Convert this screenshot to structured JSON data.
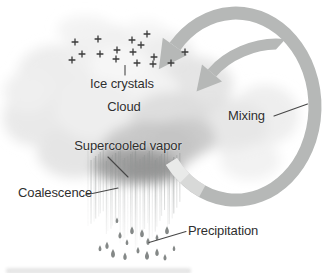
{
  "figure": {
    "background": "#ffffff",
    "labels": {
      "ice_crystals": "Ice crystals",
      "cloud": "Cloud",
      "mixing": "Mixing",
      "supercooled_vapor": "Supercooled vapor",
      "coalescence": "Coalescence",
      "precipitation": "Precipitation"
    },
    "symbols": {
      "ice_crystal_glyph": "+",
      "mixing_symbol": "counterclockwise-spiral-arrow",
      "raindrop_glyph": "teardrop"
    },
    "colors": {
      "arrow": "#b6b8b7",
      "arrow_faded": "#dedede",
      "arrow_faded2": "#ebebeb",
      "cloud_light": "#efefef",
      "cloud_dark": "#9a9a9a",
      "rain_dark": "#8a8f8e",
      "rain_mid": "#999d9c",
      "drop": "#6f7372",
      "text": "#2f2f2f",
      "leader_line": "#474747",
      "ice_crystal": "#3a3a3a"
    },
    "ice_crystal_positions": [
      [
        75,
        42
      ],
      [
        98,
        39
      ],
      [
        82,
        54
      ],
      [
        72,
        60
      ],
      [
        100,
        54
      ],
      [
        117,
        50
      ],
      [
        132,
        40
      ],
      [
        133,
        52
      ],
      [
        147,
        34
      ],
      [
        141,
        45
      ],
      [
        116,
        59
      ],
      [
        137,
        63
      ],
      [
        153,
        64
      ],
      [
        171,
        63
      ],
      [
        185,
        52
      ],
      [
        154,
        57
      ]
    ],
    "raindrop_positions": [
      [
        117,
        220
      ],
      [
        132,
        230
      ],
      [
        120,
        235
      ],
      [
        127,
        242
      ],
      [
        142,
        233
      ],
      [
        148,
        241
      ],
      [
        157,
        237
      ],
      [
        167,
        230
      ],
      [
        107,
        245
      ],
      [
        100,
        248
      ],
      [
        113,
        253
      ],
      [
        125,
        256
      ],
      [
        138,
        250
      ],
      [
        147,
        255
      ],
      [
        157,
        252
      ],
      [
        165,
        257
      ],
      [
        174,
        248
      ]
    ],
    "cloud_blobs": [
      [
        55,
        75,
        38,
        30,
        "#ededed",
        1
      ],
      [
        105,
        50,
        40,
        26,
        "#f0f0f0",
        1
      ],
      [
        160,
        55,
        34,
        24,
        "#ededed",
        1
      ],
      [
        85,
        30,
        28,
        14,
        "#f2f2f2",
        0.9
      ],
      [
        145,
        32,
        22,
        12,
        "#f4f4f4",
        0.8
      ],
      [
        35,
        118,
        32,
        28,
        "#e9e9e9",
        1
      ],
      [
        75,
        152,
        38,
        26,
        "#e5e5e5",
        1
      ],
      [
        195,
        85,
        38,
        28,
        "#e2e2e2",
        0.9
      ],
      [
        228,
        125,
        40,
        26,
        "#dfdfdf",
        0.75
      ],
      [
        265,
        115,
        34,
        30,
        "#e7e7e7",
        0.7
      ],
      [
        135,
        95,
        45,
        32,
        "#f3f3f3",
        1
      ],
      [
        95,
        110,
        40,
        30,
        "#eeeeee",
        1
      ],
      [
        170,
        120,
        40,
        28,
        "#dcdcdc",
        0.95
      ],
      [
        120,
        63,
        30,
        18,
        "#f6f6f6",
        1
      ],
      [
        250,
        160,
        30,
        20,
        "#e9e9e9",
        0.6
      ],
      [
        28,
        92,
        24,
        20,
        "#efefef",
        1
      ],
      [
        185,
        138,
        30,
        20,
        "#c9c9c9",
        0.9
      ],
      [
        150,
        148,
        48,
        26,
        "#c4c4c4",
        0.9
      ],
      [
        135,
        166,
        42,
        18,
        "#a0a0a0",
        0.95
      ],
      [
        152,
        170,
        28,
        13,
        "#959595",
        0.9
      ]
    ]
  }
}
